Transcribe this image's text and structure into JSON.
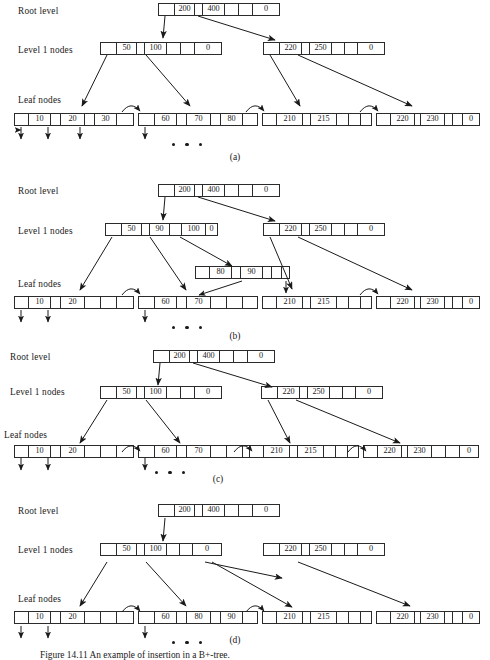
{
  "figure": {
    "caption": "Figure 14.11  An example of insertion in a B+-tree.",
    "ellipsis_glyph": "•"
  },
  "labels": {
    "root_level": "Root level",
    "level1": "Level 1 nodes",
    "leaf": "Leaf nodes"
  },
  "colors": {
    "ink": "#1a1a1a",
    "border": "#2b2b2b",
    "background": "#ffffff"
  },
  "panels": [
    {
      "id": "a",
      "caption": "(a)",
      "root": {
        "cells": [
          "",
          "200",
          "",
          "400",
          "",
          "",
          "0"
        ]
      },
      "level1": [
        {
          "cells": [
            "",
            "50",
            "",
            "100",
            "",
            "",
            "0"
          ]
        },
        {
          "cells": [
            "",
            "220",
            "",
            "250",
            "",
            "",
            "0"
          ]
        }
      ],
      "leaves": [
        {
          "cells": [
            "",
            "10",
            "",
            "20",
            "",
            "30",
            ""
          ]
        },
        {
          "cells": [
            "",
            "60",
            "",
            "70",
            "",
            "80",
            ""
          ]
        },
        {
          "cells": [
            "",
            "210",
            "",
            "215",
            "",
            "",
            ""
          ]
        },
        {
          "cells": [
            "",
            "220",
            "",
            "230",
            "",
            "",
            "0"
          ]
        }
      ]
    },
    {
      "id": "b",
      "caption": "(b)",
      "root": {
        "cells": [
          "",
          "200",
          "",
          "400",
          "",
          "",
          "0"
        ]
      },
      "level1": [
        {
          "cells": [
            "",
            "50",
            "",
            "90",
            "",
            "100",
            "0"
          ]
        },
        {
          "cells": [
            "",
            "220",
            "",
            "250",
            "",
            "",
            "0"
          ]
        }
      ],
      "floating_leaf": {
        "cells": [
          "",
          "80",
          "",
          "90",
          "",
          "",
          ""
        ]
      },
      "leaves": [
        {
          "cells": [
            "",
            "10",
            "",
            "20",
            "",
            "",
            ""
          ]
        },
        {
          "cells": [
            "",
            "60",
            "",
            "70",
            "",
            "",
            ""
          ]
        },
        {
          "cells": [
            "",
            "210",
            "",
            "215",
            "",
            "",
            ""
          ]
        },
        {
          "cells": [
            "",
            "220",
            "",
            "230",
            "",
            "",
            "0"
          ]
        }
      ]
    },
    {
      "id": "c",
      "caption": "(c)",
      "root": {
        "cells": [
          "",
          "200",
          "",
          "400",
          "",
          "",
          "0"
        ]
      },
      "level1": [
        {
          "cells": [
            "",
            "50",
            "",
            "100",
            "",
            "",
            "0"
          ]
        },
        {
          "cells": [
            "",
            "220",
            "",
            "250",
            "",
            "",
            "0"
          ]
        }
      ],
      "leaves": [
        {
          "cells": [
            "",
            "10",
            "",
            "20",
            "",
            "",
            ""
          ]
        },
        {
          "cells": [
            "",
            "60",
            "",
            "70",
            "",
            "",
            ""
          ]
        },
        {
          "cells": [
            "",
            "210",
            "",
            "215",
            "",
            "",
            ""
          ]
        },
        {
          "cells": [
            "",
            "220",
            "",
            "230",
            "",
            "",
            "0"
          ]
        }
      ]
    },
    {
      "id": "d",
      "caption": "(d)",
      "root": {
        "cells": [
          "",
          "200",
          "",
          "400",
          "",
          "",
          "0"
        ]
      },
      "level1": [
        {
          "cells": [
            "",
            "50",
            "",
            "100",
            "",
            "",
            "0"
          ]
        },
        {
          "cells": [
            "",
            "220",
            "",
            "250",
            "",
            "",
            "0"
          ]
        }
      ],
      "leaves": [
        {
          "cells": [
            "",
            "10",
            "",
            "20",
            "",
            "",
            ""
          ]
        },
        {
          "cells": [
            "",
            "60",
            "",
            "80",
            "",
            "90",
            ""
          ]
        },
        {
          "cells": [
            "",
            "210",
            "",
            "215",
            "",
            "",
            ""
          ]
        },
        {
          "cells": [
            "",
            "220",
            "",
            "230",
            "",
            "",
            "0"
          ]
        }
      ]
    }
  ]
}
